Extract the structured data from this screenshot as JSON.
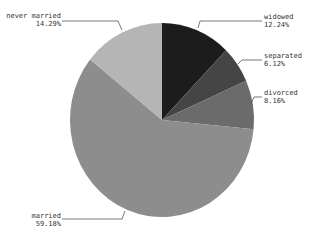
{
  "chart_data": {
    "type": "pie",
    "title": "",
    "start_angle_deg": 0,
    "direction": "clockwise",
    "slices": [
      {
        "label": "widowed",
        "value": 12.24,
        "display": "12.24%",
        "color": "#1c1c1c"
      },
      {
        "label": "separated",
        "value": 6.12,
        "display": "6.12%",
        "color": "#454545"
      },
      {
        "label": "divorced",
        "value": 8.16,
        "display": "8.16%",
        "color": "#6b6b6b"
      },
      {
        "label": "married",
        "value": 59.18,
        "display": "59.18%",
        "color": "#8d8d8d"
      },
      {
        "label": "never married",
        "value": 14.29,
        "display": "14.29%",
        "color": "#b5b5b5"
      }
    ],
    "categories": [
      "widowed",
      "separated",
      "divorced",
      "married",
      "never married"
    ],
    "values": [
      12.24,
      6.12,
      8.16,
      59.18,
      14.29
    ]
  },
  "labels": {
    "widowed": {
      "name": "widowed",
      "pct": "12.24%"
    },
    "separated": {
      "name": "separated",
      "pct": "6.12%"
    },
    "divorced": {
      "name": "divorced",
      "pct": "8.16%"
    },
    "married": {
      "name": "married",
      "pct": "59.18%"
    },
    "never_married": {
      "name": "never married",
      "pct": "14.29%"
    }
  }
}
